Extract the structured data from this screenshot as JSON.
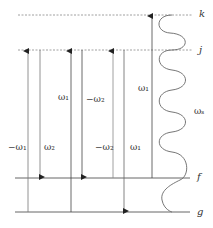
{
  "levels": [
    {
      "name": "k",
      "y": 15,
      "style": "dashed"
    },
    {
      "name": "j",
      "y": 50,
      "style": "dashed"
    },
    {
      "name": "f",
      "y": 178,
      "style": "solid"
    },
    {
      "name": "g",
      "y": 212,
      "style": "solid"
    }
  ],
  "arrows": [
    {
      "x": 28,
      "from": "g",
      "to": "j",
      "label": "−ω₁",
      "lx": 8,
      "ly": 142
    },
    {
      "x": 40,
      "from": "j",
      "to": "f",
      "label": "ω₂",
      "lx": 44,
      "ly": 142
    },
    {
      "x": 71,
      "from": "g",
      "to": "j",
      "label": "ω₁",
      "lx": 58,
      "ly": 92
    },
    {
      "x": 82,
      "from": "j",
      "to": "f",
      "label": "−ω₂",
      "lx": 86,
      "ly": 94
    },
    {
      "x": 113,
      "from": "f",
      "to": "j",
      "label": "−ω₂",
      "lx": 95,
      "ly": 142
    },
    {
      "x": 124,
      "from": "j",
      "to": "g",
      "label": "ω₁",
      "lx": 130,
      "ly": 142
    },
    {
      "x": 152,
      "from": "f",
      "to": "k",
      "label": "ω₁",
      "lx": 138,
      "ly": 83
    }
  ],
  "wave": {
    "label": "ωₛ",
    "lx": 194,
    "ly": 106
  },
  "level_labels": {
    "k": "k",
    "j": "j",
    "f": "f",
    "g": "g"
  },
  "colors": {
    "line": "#555555",
    "dash": "#888888"
  }
}
